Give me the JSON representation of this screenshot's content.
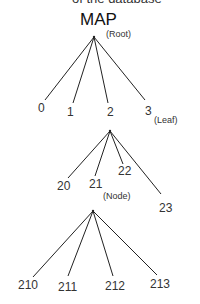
{
  "header": {
    "cut_off_text": "of the database",
    "title": "MAP"
  },
  "annotations": {
    "root": "(Root)",
    "leaf": "(Leaf)",
    "node": "(Node)"
  },
  "tree": {
    "level1": [
      "0",
      "1",
      "2",
      "3"
    ],
    "level2": [
      "20",
      "21",
      "22",
      "23"
    ],
    "level3": [
      "210",
      "211",
      "212",
      "213"
    ]
  },
  "colors": {
    "line": "#222222",
    "text": "#333333",
    "background": "#ffffff"
  }
}
